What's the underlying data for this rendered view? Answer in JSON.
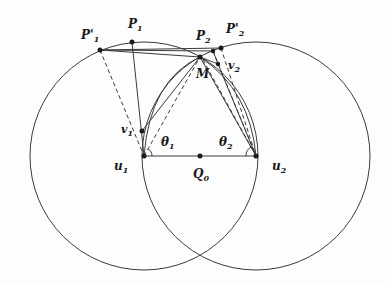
{
  "diagram": {
    "type": "geometry",
    "colors": {
      "stroke": "#3a3a3a",
      "point": "#1a1a1a",
      "background": "#fdfdfd"
    },
    "labels": {
      "P1p": {
        "main": "P'",
        "sub": "1"
      },
      "P1": {
        "main": "P",
        "sub": "1"
      },
      "P2": {
        "main": "P",
        "sub": "2"
      },
      "P2p": {
        "main": "P'",
        "sub": "2"
      },
      "M": {
        "main": "M",
        "sub": ""
      },
      "v1": {
        "main": "v",
        "sub": "1"
      },
      "v2": {
        "main": "v",
        "sub": "2"
      },
      "theta1": {
        "main": "θ",
        "sub": "1"
      },
      "theta2": {
        "main": "θ",
        "sub": "2"
      },
      "u1": {
        "main": "u",
        "sub": "1"
      },
      "u2": {
        "main": "u",
        "sub": "2"
      },
      "Q0": {
        "main": "Q",
        "sub": "0"
      }
    },
    "points": {
      "u1": [
        144,
        156
      ],
      "u2": [
        256,
        156
      ],
      "Q0": [
        200,
        156
      ],
      "P1p": [
        100,
        50
      ],
      "P1": [
        132,
        42
      ],
      "P2": [
        200,
        57
      ],
      "J": [
        213,
        51
      ],
      "P2p": [
        221,
        48
      ],
      "v1": [
        142,
        131
      ],
      "v2": [
        218,
        64
      ]
    },
    "circles": [
      {
        "name": "circle-u1",
        "center": "u1",
        "radius": 114
      },
      {
        "name": "circle-u2",
        "center": "u2",
        "radius": 114
      }
    ]
  }
}
